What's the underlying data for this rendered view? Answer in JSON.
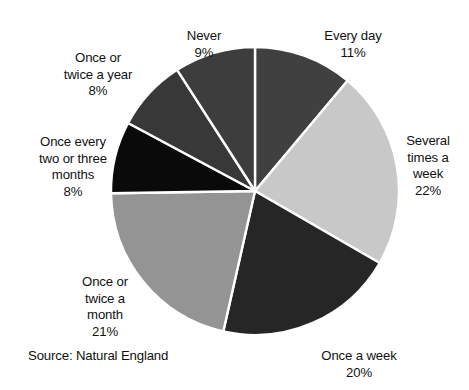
{
  "chart_data": {
    "type": "pie",
    "title": "",
    "subtitle": "",
    "xlabel": "",
    "ylabel": "",
    "legend_position": "none",
    "grid": false,
    "units": "percent",
    "start_angle_deg": 0,
    "direction": "clockwise",
    "center": {
      "x": 255,
      "y": 191
    },
    "radius": 144,
    "slice_separator_color": "#ffffff",
    "background_color": "#ffffff",
    "categories": [
      "Every day",
      "Several times a week",
      "Once a week",
      "Once or twice a month",
      "Once every two or three months",
      "Once or twice a year",
      "Never"
    ],
    "values": [
      11,
      22,
      20,
      21,
      8,
      8,
      9
    ],
    "colors": [
      "#404040",
      "#c8c8c8",
      "#262626",
      "#949494",
      "#0a0a0a",
      "#383838",
      "#3d3d3d"
    ],
    "slices": [
      {
        "id": "every-day",
        "label": "Every day",
        "label_lines": "Every day",
        "value": 11,
        "percent_text": "11%",
        "color": "#404040"
      },
      {
        "id": "several-times-a-week",
        "label": "Several times a week",
        "label_lines": "Several\ntimes a\nweek",
        "value": 22,
        "percent_text": "22%",
        "color": "#c8c8c8"
      },
      {
        "id": "once-a-week",
        "label": "Once a week",
        "label_lines": "Once a week",
        "value": 20,
        "percent_text": "20%",
        "color": "#262626"
      },
      {
        "id": "once-or-twice-a-month",
        "label": "Once or twice a month",
        "label_lines": "Once or\ntwice a\nmonth",
        "value": 21,
        "percent_text": "21%",
        "color": "#949494"
      },
      {
        "id": "once-every-two-or-three-months",
        "label": "Once every two or three months",
        "label_lines": "Once every\ntwo or three\nmonths",
        "value": 8,
        "percent_text": "8%",
        "color": "#0a0a0a"
      },
      {
        "id": "once-or-twice-a-year",
        "label": "Once or twice a year",
        "label_lines": "Once or\ntwice a year",
        "value": 8,
        "percent_text": "8%",
        "color": "#383838"
      },
      {
        "id": "never",
        "label": "Never",
        "label_lines": "Never",
        "value": 9,
        "percent_text": "9%",
        "color": "#3d3d3d"
      }
    ],
    "annotations": [
      "Source: Natural England"
    ]
  },
  "source_note": "Source: Natural England"
}
